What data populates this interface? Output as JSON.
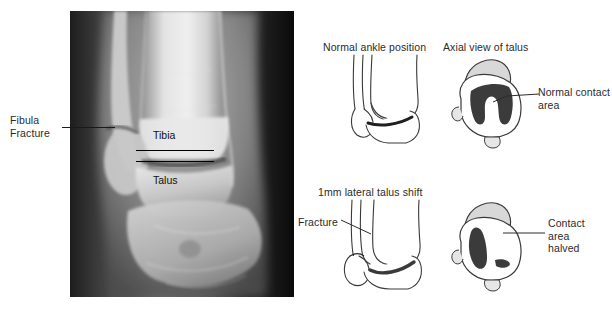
{
  "figure": {
    "type": "medical-illustration"
  },
  "xray": {
    "caption_fibula": "Fibula\nFracture",
    "label_tibia": "Tibia",
    "label_talus": "Talus"
  },
  "diagrams": {
    "normal_ankle": {
      "heading": "Normal ankle position"
    },
    "axial_normal": {
      "heading": "Axial view of talus",
      "callout": "Normal contact\narea"
    },
    "shifted_ankle": {
      "heading": "1mm lateral talus shift",
      "callout": "Fracture"
    },
    "axial_shifted": {
      "callout": "Contact\narea\nhalved"
    }
  },
  "colors": {
    "ink": "#2b2b2b",
    "line": "#3a3a3a",
    "bone_fill": "#ffffff",
    "bone_shade": "#d8d8d8",
    "contact_dark": "#3b3b3b",
    "background": "#ffffff"
  }
}
